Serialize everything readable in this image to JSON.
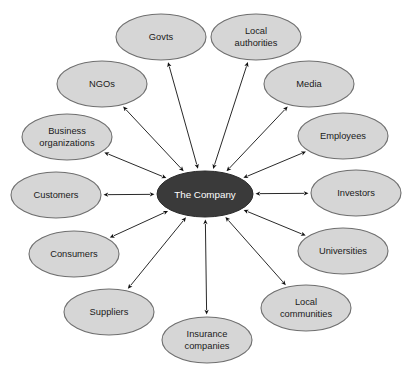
{
  "diagram": {
    "background_color": "#ffffff",
    "center": {
      "label": "The Company",
      "fill": "#3a3a3a",
      "text_color": "#ffffff",
      "cx": 205,
      "cy": 194,
      "rx": 48,
      "ry": 23
    },
    "node_style": {
      "fill": "#d6d6d6",
      "stroke": "#6f6f6f",
      "text_color": "#1a1a1a"
    },
    "connector": {
      "style": "double-headed-arrow",
      "color": "#111111"
    },
    "nodes": [
      {
        "id": "govts",
        "label": "Govts",
        "lines": [
          "Govts"
        ],
        "cx": 161,
        "cy": 37,
        "rx": 45,
        "ry": 23
      },
      {
        "id": "local-authorities",
        "label": "Local authorities",
        "lines": [
          "Local",
          "authorities"
        ],
        "cx": 256,
        "cy": 37,
        "rx": 45,
        "ry": 23
      },
      {
        "id": "media",
        "label": "Media",
        "lines": [
          "Media"
        ],
        "cx": 309,
        "cy": 84,
        "rx": 45,
        "ry": 23
      },
      {
        "id": "employees",
        "label": "Employees",
        "lines": [
          "Employees"
        ],
        "cx": 343,
        "cy": 136,
        "rx": 45,
        "ry": 23
      },
      {
        "id": "investors",
        "label": "Investors",
        "lines": [
          "Investors"
        ],
        "cx": 356,
        "cy": 193,
        "rx": 45,
        "ry": 23
      },
      {
        "id": "universities",
        "label": "Universities",
        "lines": [
          "Universities"
        ],
        "cx": 343,
        "cy": 251,
        "rx": 45,
        "ry": 23
      },
      {
        "id": "local-communities",
        "label": "Local communities",
        "lines": [
          "Local",
          "communities"
        ],
        "cx": 306,
        "cy": 308,
        "rx": 45,
        "ry": 23
      },
      {
        "id": "insurance-companies",
        "label": "Insurance companies",
        "lines": [
          "Insurance",
          "companies"
        ],
        "cx": 207,
        "cy": 340,
        "rx": 45,
        "ry": 23
      },
      {
        "id": "suppliers",
        "label": "Suppliers",
        "lines": [
          "Suppliers"
        ],
        "cx": 109,
        "cy": 312,
        "rx": 45,
        "ry": 23
      },
      {
        "id": "consumers",
        "label": "Consumers",
        "lines": [
          "Consumers"
        ],
        "cx": 74,
        "cy": 254,
        "rx": 45,
        "ry": 23
      },
      {
        "id": "customers",
        "label": "Customers",
        "lines": [
          "Customers"
        ],
        "cx": 56,
        "cy": 195,
        "rx": 45,
        "ry": 23
      },
      {
        "id": "business-organizations",
        "label": "Business organizations",
        "lines": [
          "Business",
          "organizations"
        ],
        "cx": 67,
        "cy": 137,
        "rx": 45,
        "ry": 23
      },
      {
        "id": "ngos",
        "label": "NGOs",
        "lines": [
          "NGOs"
        ],
        "cx": 102,
        "cy": 84,
        "rx": 45,
        "ry": 23
      }
    ]
  }
}
